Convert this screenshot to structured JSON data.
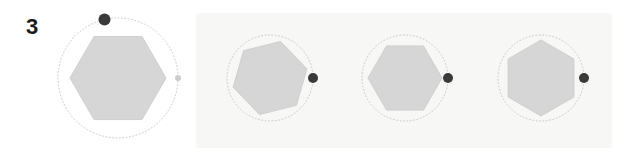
{
  "step": {
    "number": "3"
  },
  "colors": {
    "page_background": "#ffffff",
    "highlight_background": "#f7f7f6",
    "hexagon_fill": "#d6d6d6",
    "hexagon_stroke": "#cfcfcf",
    "circle_stroke": "#c9c9c9",
    "circle_stroke_faint": "#dcdcdc",
    "marker_dot": "#3a3a3a",
    "marker_dot_faint": "#c9c9c9",
    "label_color": "#1b1b1b"
  },
  "highlight_region": {
    "label": "selected-frames-region",
    "x": 196,
    "y": 13,
    "width": 416,
    "height": 135
  },
  "panels": [
    {
      "id": "panel-1",
      "name": "rotation-frame-1",
      "highlighted": false,
      "center_x": 118,
      "center_y": 78,
      "circle_radius": 60,
      "circle_style": "dotted",
      "hexagon_radius": 48,
      "hexagon_rotation_deg": 0,
      "marker": {
        "angle_deg": -103,
        "radius": 6.0,
        "color": "#3a3a3a",
        "label": "primary-handle"
      },
      "secondary_marker": {
        "angle_deg": 0,
        "radius": 3.0,
        "color": "#cccccc",
        "label": "ghost-handle"
      }
    },
    {
      "id": "panel-2",
      "name": "rotation-frame-2",
      "highlighted": true,
      "center_x": 270,
      "center_y": 78,
      "circle_radius": 43,
      "circle_style": "dotted",
      "hexagon_radius": 38,
      "hexagon_rotation_deg": -14,
      "marker": {
        "angle_deg": 0,
        "radius": 5.0,
        "color": "#3a3a3a",
        "label": "primary-handle"
      },
      "secondary_marker": null
    },
    {
      "id": "panel-3",
      "name": "rotation-frame-3",
      "highlighted": true,
      "center_x": 405,
      "center_y": 78,
      "circle_radius": 43,
      "circle_style": "dotted",
      "hexagon_radius": 37,
      "hexagon_rotation_deg": 0,
      "marker": {
        "angle_deg": 0,
        "radius": 5.0,
        "color": "#3a3a3a",
        "label": "primary-handle"
      },
      "secondary_marker": null
    },
    {
      "id": "panel-4",
      "name": "rotation-frame-4",
      "highlighted": true,
      "center_x": 541,
      "center_y": 78,
      "circle_radius": 43,
      "circle_style": "dotted",
      "hexagon_radius": 38,
      "hexagon_rotation_deg": 30,
      "marker": {
        "angle_deg": 0,
        "radius": 5.0,
        "color": "#3a3a3a",
        "label": "primary-handle"
      },
      "secondary_marker": null
    }
  ]
}
